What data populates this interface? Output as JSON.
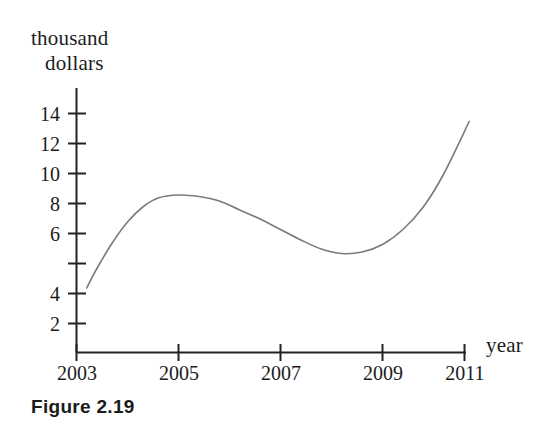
{
  "figure": {
    "caption": "Figure 2.19"
  },
  "chart_data": {
    "type": "line",
    "title": "",
    "subtitle": "",
    "xlabel": "year",
    "ylabel": "thousand dollars",
    "ylabel_line1": "thousand",
    "ylabel_line2": "dollars",
    "grid": false,
    "legend": null,
    "legend_position": "none",
    "line_color": "#7a7a7a",
    "axis_color": "#222222",
    "xlim": [
      2003,
      2011
    ],
    "ylim": [
      0,
      15.6
    ],
    "xticks": [
      2003,
      2005,
      2007,
      2009,
      2011
    ],
    "xtick_labels": [
      "2003",
      "2005",
      "2007",
      "2009",
      "2011"
    ],
    "yticks": [
      2,
      4,
      6,
      8,
      10,
      12,
      14
    ],
    "ytick_labels": [
      "2",
      "4",
      "6",
      "8",
      "10",
      "12",
      "14"
    ],
    "annotations": [],
    "x": [
      2003.2,
      2003.4,
      2003.7,
      2004.0,
      2004.3,
      2004.6,
      2005.0,
      2005.4,
      2005.8,
      2006.2,
      2006.6,
      2007.0,
      2007.4,
      2007.8,
      2008.2,
      2008.6,
      2009.0,
      2009.4,
      2009.8,
      2010.2,
      2010.7
    ],
    "y": [
      4.3,
      5.6,
      7.3,
      8.7,
      9.7,
      10.3,
      10.5,
      10.4,
      10.1,
      9.5,
      8.9,
      8.2,
      7.5,
      6.9,
      6.6,
      6.7,
      7.2,
      8.2,
      9.7,
      11.9,
      15.4
    ],
    "key_points": {
      "start": {
        "x": 2003.2,
        "y": 4.3
      },
      "local_maximum": {
        "x": 2005.0,
        "y": 10.5
      },
      "local_minimum": {
        "x": 2008.2,
        "y": 6.6
      },
      "end": {
        "x": 2010.7,
        "y": 15.4
      }
    }
  }
}
